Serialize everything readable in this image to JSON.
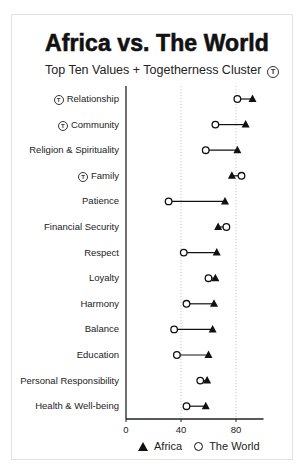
{
  "header": {
    "title": "Africa vs. The World",
    "subtitle": "Top Ten Values + Togetherness Cluster",
    "cluster_icon": "circled-t-icon"
  },
  "legend": {
    "africa_label": "Africa",
    "africa_marker": "filled-triangle",
    "world_label": "The World",
    "world_marker": "open-circle"
  },
  "colors": {
    "marker": "#111111",
    "axis": "#222222",
    "grid": "#c8c8c8",
    "card_border": "#e2e2e2"
  },
  "chart_data": {
    "type": "dumbbell",
    "title": "Africa vs. The World",
    "subtitle": "Top Ten Values + Togetherness Cluster",
    "xlabel": "",
    "ylabel": "",
    "xlim": [
      0,
      100
    ],
    "x_ticks": [
      0,
      40,
      80
    ],
    "grid": {
      "vertical_dotted_at": [
        40,
        80
      ]
    },
    "legend_position": "bottom",
    "categories": [
      "Relationship",
      "Community",
      "Religion & Spirituality",
      "Family",
      "Patience",
      "Financial Security",
      "Respect",
      "Loyalty",
      "Harmony",
      "Balance",
      "Education",
      "Personal Responsibility",
      "Health & Well-being"
    ],
    "togetherness_cluster": [
      true,
      true,
      false,
      true,
      false,
      false,
      false,
      false,
      false,
      false,
      false,
      false,
      false
    ],
    "series": [
      {
        "name": "Africa",
        "marker": "triangle",
        "values": [
          92,
          87,
          81,
          77,
          72,
          67,
          66,
          65,
          64,
          63,
          60,
          59,
          58
        ]
      },
      {
        "name": "The World",
        "marker": "circle",
        "values": [
          81,
          65,
          58,
          84,
          31,
          73,
          42,
          60,
          44,
          35,
          37,
          54,
          44
        ]
      }
    ]
  }
}
